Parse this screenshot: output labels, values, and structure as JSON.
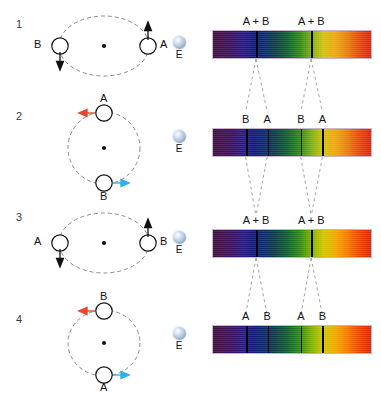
{
  "diagram": {
    "observer_label": "E",
    "merged_line_label": "A + B",
    "colors": {
      "redshift_arrow": "#e8472a",
      "blueshift_arrow": "#2bb3e8",
      "neutral_arrow": "#111111",
      "orbit_dash": "#8a8a8a",
      "absorption_line": "#07070a",
      "earth_sphere": "#aabed8"
    },
    "rows": [
      {
        "number": "1",
        "phase": "quadrature-tangential-1",
        "stars": [
          {
            "id": "B",
            "label": "B",
            "position": "left",
            "arrow": "down",
            "arrow_color": "#111111",
            "shift": "none"
          },
          {
            "id": "A",
            "label": "A",
            "position": "right",
            "arrow": "up",
            "arrow_color": "#111111",
            "shift": "none"
          }
        ],
        "bottom_label": "A",
        "observer": "E",
        "spectrum": {
          "split": false,
          "lines": [
            {
              "label": "A + B",
              "pct": 27.5
            },
            {
              "label": "A + B",
              "pct": 62.0
            }
          ]
        }
      },
      {
        "number": "2",
        "phase": "maximum-separation-1",
        "stars": [
          {
            "id": "A",
            "label": "A",
            "position": "top",
            "arrow": "left",
            "arrow_color": "#e8472a",
            "shift": "red"
          },
          {
            "id": "B",
            "label": "B",
            "position": "bottom",
            "arrow": "right",
            "arrow_color": "#2bb3e8",
            "shift": "blue"
          }
        ],
        "observer": "E",
        "spectrum": {
          "split": true,
          "lines": [
            {
              "label": "B",
              "pct": 21.0
            },
            {
              "label": "A",
              "pct": 34.5
            },
            {
              "label": "B",
              "pct": 55.5
            },
            {
              "label": "A",
              "pct": 69.0
            }
          ]
        }
      },
      {
        "number": "3",
        "phase": "quadrature-tangential-2",
        "stars": [
          {
            "id": "A",
            "label": "A",
            "position": "left",
            "arrow": "down",
            "arrow_color": "#111111",
            "shift": "none"
          },
          {
            "id": "B",
            "label": "B",
            "position": "right",
            "arrow": "up",
            "arrow_color": "#111111",
            "shift": "none"
          }
        ],
        "bottom_label": "B",
        "observer": "E",
        "spectrum": {
          "split": false,
          "lines": [
            {
              "label": "A + B",
              "pct": 27.5
            },
            {
              "label": "A + B",
              "pct": 62.0
            }
          ]
        }
      },
      {
        "number": "4",
        "phase": "maximum-separation-2",
        "stars": [
          {
            "id": "B",
            "label": "B",
            "position": "top",
            "arrow": "left",
            "arrow_color": "#e8472a",
            "shift": "red"
          },
          {
            "id": "A",
            "label": "A",
            "position": "bottom",
            "arrow": "right",
            "arrow_color": "#2bb3e8",
            "shift": "blue"
          }
        ],
        "observer": "E",
        "spectrum": {
          "split": true,
          "lines": [
            {
              "label": "A",
              "pct": 21.0
            },
            {
              "label": "B",
              "pct": 34.5
            },
            {
              "label": "A",
              "pct": 55.5
            },
            {
              "label": "B",
              "pct": 69.0
            }
          ]
        }
      }
    ]
  }
}
